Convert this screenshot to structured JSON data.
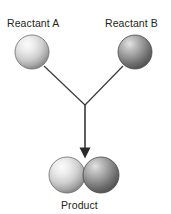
{
  "diagram": {
    "type": "chemical-reaction-schematic",
    "background_color": "#ffffff",
    "width": 171,
    "height": 214,
    "labels": {
      "reactant_a": "Reactant A",
      "reactant_b": "Reactant B",
      "product": "Product"
    },
    "label_color": "#231f20",
    "connector_color": "#3a3a3a",
    "arrow_color": "#2b2b2b",
    "atoms": {
      "reactant_a": {
        "name": "Reactant A",
        "cx": 32,
        "cy": 52,
        "r": 17,
        "fill_light": "#f2f2f2",
        "fill_mid": "#c9c9c9",
        "fill_dark": "#8e8e8e",
        "stroke": "#6b6b6b",
        "shade": "light-gray"
      },
      "reactant_b": {
        "name": "Reactant B",
        "cx": 135,
        "cy": 52,
        "r": 17,
        "fill_light": "#d8d8d8",
        "fill_mid": "#9a9a9a",
        "fill_dark": "#5c5c5c",
        "stroke": "#4a4a4a",
        "shade": "dark-gray"
      },
      "product_left": {
        "name": "Product atom A",
        "cx": 67,
        "cy": 175,
        "r": 18,
        "fill_light": "#f2f2f2",
        "fill_mid": "#c9c9c9",
        "fill_dark": "#8e8e8e",
        "stroke": "#6b6b6b",
        "shade": "light-gray"
      },
      "product_right": {
        "name": "Product atom B",
        "cx": 101,
        "cy": 175,
        "r": 18,
        "fill_light": "#d8d8d8",
        "fill_mid": "#9a9a9a",
        "fill_dark": "#5c5c5c",
        "stroke": "#4a4a4a",
        "shade": "dark-gray"
      }
    },
    "connectors": {
      "left_leg": {
        "x1": 44,
        "y1": 66,
        "x2": 85,
        "y2": 105
      },
      "right_leg": {
        "x1": 123,
        "y1": 66,
        "x2": 85,
        "y2": 105
      },
      "arrow_shaft": {
        "x1": 85,
        "y1": 105,
        "x2": 85,
        "y2": 149
      },
      "arrow_head": {
        "x": 85,
        "y": 158,
        "half_width": 5.5,
        "height": 10
      }
    }
  }
}
